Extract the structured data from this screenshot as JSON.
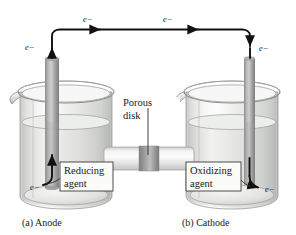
{
  "figure": {
    "background_color": "#ffffff"
  },
  "wire": {
    "electron_label_left_outer": "e−",
    "electron_label_top_left": "e−",
    "electron_label_top_right": "e−",
    "electron_label_right_outer": "e−",
    "color": "#111111"
  },
  "left_cell": {
    "caption": "(a) Anode",
    "callout_line1": "Reducing",
    "callout_line2": "agent",
    "electron_label": "e−",
    "electrode_color": "#9a9a9a",
    "solution_color": "#e9eae8"
  },
  "right_cell": {
    "caption": "(b) Cathode",
    "callout_line1": "Oxidizing",
    "callout_line2": "agent",
    "electron_label": "e−",
    "electrode_color": "#9a9a9a",
    "solution_color": "#e9eae8"
  },
  "bridge": {
    "callout_line1": "Porous",
    "callout_line2": "disk",
    "disk_color": "#8c8c8c",
    "tube_color": "#e4e5e3"
  }
}
